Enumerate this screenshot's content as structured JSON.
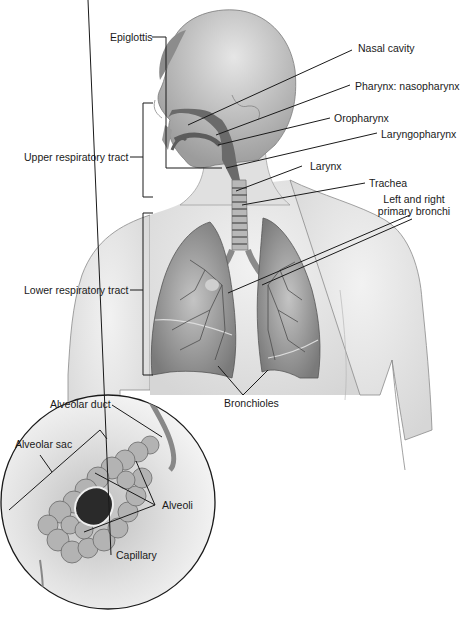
{
  "diagram": {
    "type": "anatomical-illustration",
    "labels": {
      "epiglottis": "Epiglottis",
      "nasal_cavity": "Nasal cavity",
      "nasopharynx": "Pharynx: nasopharynx",
      "oropharynx": "Oropharynx",
      "laryngopharynx": "Laryngopharynx",
      "larynx": "Larynx",
      "trachea": "Trachea",
      "bronchi_line1": "Left and right",
      "bronchi_line2": "primary bronchi",
      "upper_tract": "Upper respiratory tract",
      "lower_tract": "Lower respiratory tract",
      "bronchioles": "Bronchioles",
      "alveolar_duct": "Alveolar duct",
      "alveolar_sac": "Alveolar sac",
      "alveoli": "Alveoli",
      "capillary": "Capillary"
    },
    "colors": {
      "line": "#1a1a1a",
      "skin": "#e4e4e4",
      "skin_shade": "#b8b8b8",
      "airway": "#6e6e6e",
      "lung": "#9a9a9a",
      "lung_dark": "#555555",
      "inset_bg": "#d8d8d8"
    }
  }
}
